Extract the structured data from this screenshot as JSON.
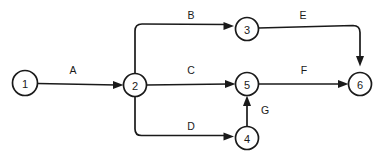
{
  "diagram": {
    "type": "activity-on-arrow-network",
    "width": 382,
    "height": 160,
    "background_color": "#ffffff",
    "stroke_color": "#1a1a1a",
    "nodes": [
      {
        "id": "n1",
        "label": "1",
        "cx": 25,
        "cy": 83,
        "r": 12.5
      },
      {
        "id": "n2",
        "label": "2",
        "cx": 135,
        "cy": 85,
        "r": 11.5
      },
      {
        "id": "n3",
        "label": "3",
        "cx": 247,
        "cy": 29,
        "r": 11.5
      },
      {
        "id": "n4",
        "label": "4",
        "cx": 247,
        "cy": 138,
        "r": 11.5
      },
      {
        "id": "n5",
        "label": "5",
        "cx": 247,
        "cy": 84,
        "r": 11.5
      },
      {
        "id": "n6",
        "label": "6",
        "cx": 360,
        "cy": 84,
        "r": 11.5
      }
    ],
    "edges": [
      {
        "id": "eA",
        "label": "A",
        "from": "1",
        "to": "2",
        "label_x": 73,
        "label_y": 70
      },
      {
        "id": "eB",
        "label": "B",
        "from": "2",
        "to": "3",
        "label_x": 191,
        "label_y": 15
      },
      {
        "id": "eC",
        "label": "C",
        "from": "2",
        "to": "5",
        "label_x": 191,
        "label_y": 70
      },
      {
        "id": "eD",
        "label": "D",
        "from": "2",
        "to": "4",
        "label_x": 191,
        "label_y": 126
      },
      {
        "id": "eE",
        "label": "E",
        "from": "3",
        "to": "6",
        "label_x": 303,
        "label_y": 15
      },
      {
        "id": "eF",
        "label": "F",
        "from": "5",
        "to": "6",
        "label_x": 304,
        "label_y": 70
      },
      {
        "id": "eG",
        "label": "G",
        "from": "4",
        "to": "5",
        "label_x": 265,
        "label_y": 110
      }
    ]
  }
}
